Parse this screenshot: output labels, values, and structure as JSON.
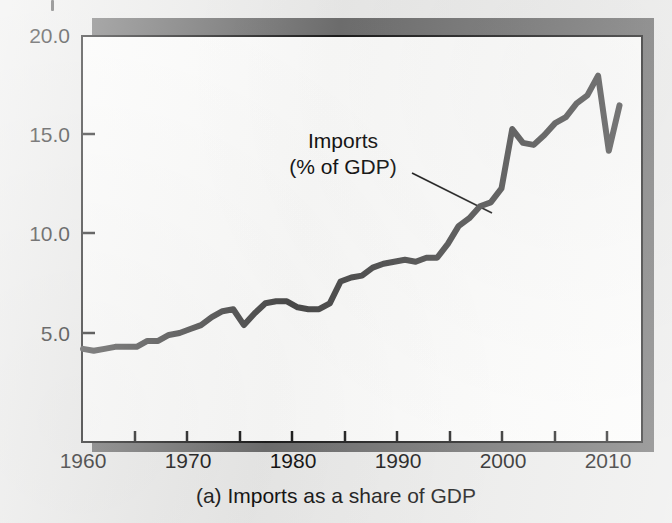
{
  "figure": {
    "caption": "(a) Imports as a share of GDP",
    "annotation_line1": "Imports",
    "annotation_line2": "(% of GDP)",
    "frame_color": "#1c1c1c",
    "shadow_color": "#6f6f6f",
    "line_color": "#4a4a4a",
    "background_color": "#ececeb",
    "plot_background_color": "#fdfdfc"
  },
  "chart_data": {
    "type": "line",
    "title": "(a) Imports as a share of GDP",
    "xlabel": "",
    "ylabel": "",
    "series_name": "Imports (% of GDP)",
    "xlim": [
      1960,
      2012
    ],
    "ylim": [
      0,
      20
    ],
    "yticks": [
      5.0,
      10.0,
      15.0,
      20.0
    ],
    "ytick_labels": [
      "5.0",
      "10.0",
      "15.0",
      "20.0"
    ],
    "xticks": [
      1960,
      1970,
      1980,
      1990,
      2000,
      2010
    ],
    "xtick_labels": [
      "1960",
      "1970",
      "1980",
      "1990",
      "2000",
      "2010"
    ],
    "xminor_ticks": [
      1965,
      1975,
      1985,
      1995,
      2005
    ],
    "grid": false,
    "legend": "annotation",
    "annotation": {
      "text": "Imports\n(% of GDP)",
      "points_to_year": 1997,
      "points_to_value": 12.3
    },
    "x": [
      1960,
      1961,
      1962,
      1963,
      1964,
      1965,
      1966,
      1967,
      1968,
      1969,
      1970,
      1971,
      1972,
      1973,
      1974,
      1975,
      1976,
      1977,
      1978,
      1979,
      1980,
      1981,
      1982,
      1983,
      1984,
      1985,
      1986,
      1987,
      1988,
      1989,
      1990,
      1991,
      1992,
      1993,
      1994,
      1995,
      1996,
      1997,
      1998,
      1999,
      2000,
      2001,
      2002,
      2003,
      2004,
      2005,
      2006,
      2007,
      2008,
      2009,
      2010
    ],
    "values": [
      4.2,
      4.1,
      4.2,
      4.3,
      4.3,
      4.3,
      4.6,
      4.6,
      4.9,
      5.0,
      5.2,
      5.4,
      5.8,
      6.1,
      6.2,
      5.4,
      6.0,
      6.5,
      6.6,
      6.6,
      6.3,
      6.2,
      6.2,
      6.5,
      7.6,
      7.8,
      7.9,
      8.3,
      8.5,
      8.6,
      8.7,
      8.6,
      8.8,
      8.8,
      9.5,
      10.4,
      10.8,
      11.4,
      11.6,
      12.3,
      15.3,
      14.6,
      14.5,
      15.0,
      15.6,
      15.9,
      16.6,
      17.0,
      18.0,
      14.2,
      16.5
    ]
  }
}
